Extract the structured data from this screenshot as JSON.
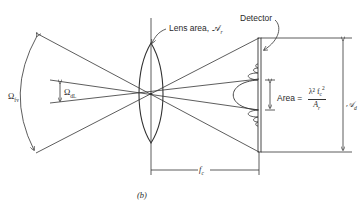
{
  "figure": {
    "panel_label": "(b)",
    "labels": {
      "lens": "Lens area, 𝒜",
      "lens_sub": "r",
      "detector": "Detector",
      "area_prefix": "Area =",
      "area_numerator": "λ² f",
      "area_numerator_sub": "c",
      "area_numerator_sup": "2",
      "area_denominator": "A",
      "area_denominator_sub": "r",
      "detector_area": "𝒜",
      "detector_area_sub": "d",
      "omega_fv": "Ω",
      "omega_fv_sub": "fv",
      "omega_dl": "Ω",
      "omega_dl_sub": "dL",
      "focal_length": "f",
      "focal_length_sub": "c"
    },
    "colors": {
      "line": "#333333",
      "background": "#ffffff"
    }
  }
}
